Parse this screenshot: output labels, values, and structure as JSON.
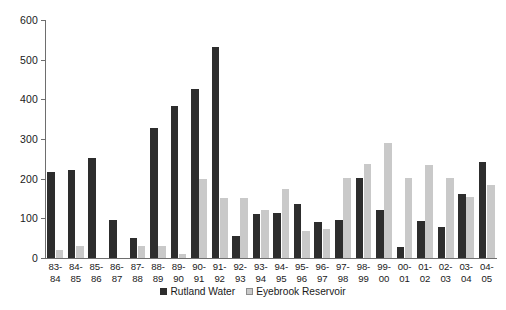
{
  "chart_data": {
    "type": "bar",
    "title": "",
    "subtitle": "",
    "xlabel": "",
    "ylabel": "",
    "ylim": [
      0,
      600
    ],
    "ytick_values": [
      0,
      100,
      200,
      300,
      400,
      500,
      600
    ],
    "ytick_labels": [
      "0",
      "100",
      "200",
      "300",
      "400",
      "500",
      "600"
    ],
    "grid": false,
    "legend_position": "bottom-center",
    "categories": [
      "83-84",
      "84-85",
      "85-86",
      "86-87",
      "87-88",
      "88-89",
      "89-90",
      "90-91",
      "91-92",
      "92-93",
      "93-94",
      "94-95",
      "95-96",
      "96-97",
      "97-98",
      "98-99",
      "99-00",
      "00-01",
      "01-02",
      "02-03",
      "03-04",
      "04-05"
    ],
    "category_lines": [
      [
        "83-",
        "84"
      ],
      [
        "84-",
        "85"
      ],
      [
        "85-",
        "86"
      ],
      [
        "86-",
        "87"
      ],
      [
        "87-",
        "88"
      ],
      [
        "88-",
        "89"
      ],
      [
        "89-",
        "90"
      ],
      [
        "90-",
        "91"
      ],
      [
        "91-",
        "92"
      ],
      [
        "92-",
        "93"
      ],
      [
        "93-",
        "94"
      ],
      [
        "94-",
        "95"
      ],
      [
        "95-",
        "96"
      ],
      [
        "96-",
        "97"
      ],
      [
        "97-",
        "98"
      ],
      [
        "98-",
        "99"
      ],
      [
        "99-",
        "00"
      ],
      [
        "00-",
        "01"
      ],
      [
        "01-",
        "02"
      ],
      [
        "02-",
        "03"
      ],
      [
        "03-",
        "04"
      ],
      [
        "04-",
        "05"
      ]
    ],
    "series": [
      {
        "name": "Rutland Water",
        "color": "#2d2d2d",
        "values": [
          218,
          222,
          253,
          96,
          50,
          327,
          384,
          425,
          531,
          55,
          111,
          114,
          135,
          90,
          97,
          201,
          120,
          28,
          93,
          78,
          162,
          241
        ]
      },
      {
        "name": "Eyebrook Reservoir",
        "color": "#c9c9c9",
        "values": [
          20,
          31,
          0,
          0,
          30,
          30,
          9,
          200,
          151,
          151,
          121,
          174,
          68,
          73,
          201,
          238,
          289,
          202,
          235,
          202,
          153,
          184
        ]
      }
    ]
  },
  "legend": {
    "items": [
      {
        "label": "Rutland Water",
        "swatch": "series-a"
      },
      {
        "label": "Eyebrook Reservoir",
        "swatch": "series-b"
      }
    ]
  }
}
